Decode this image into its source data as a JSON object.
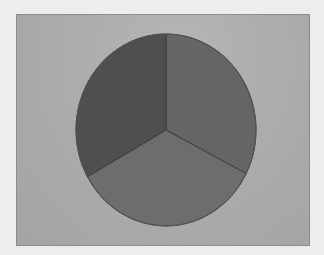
{
  "chart_data": {
    "type": "pie",
    "title": "",
    "legend": [],
    "start_angle_deg": 0,
    "direction": "clockwise",
    "slices": [
      {
        "label": "",
        "value": 32.5,
        "color": "#656565"
      },
      {
        "label": "",
        "value": 34.4,
        "color": "#6d6d6d"
      },
      {
        "label": "",
        "value": 33.1,
        "color": "#4f4f4f"
      }
    ],
    "values": [
      32.5,
      34.4,
      33.1
    ],
    "categories": [
      "",
      "",
      ""
    ],
    "geometry": {
      "cx": 166,
      "cy": 130,
      "rx": 90,
      "ry": 96
    }
  },
  "panel": {
    "background": "#acacac",
    "border": "#8c8c8c"
  }
}
